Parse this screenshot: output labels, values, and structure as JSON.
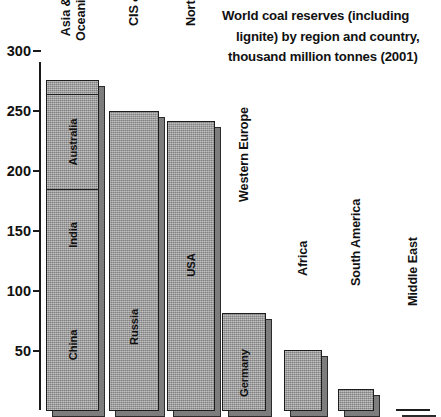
{
  "chart": {
    "title_lines": [
      "World coal reserves (including",
      "lignite) by region and country,",
      "thousand million tonnes (2001)"
    ],
    "axis": {
      "ticks": [
        "300",
        "250",
        "200",
        "150",
        "100",
        "50"
      ]
    }
  },
  "chart_data": {
    "type": "bar",
    "title": "World coal reserves (including lignite) by region and country, thousand million tonnes (2001)",
    "xlabel": "",
    "ylabel": "",
    "ylim": [
      0,
      310
    ],
    "yticks": [
      50,
      100,
      150,
      200,
      250,
      300
    ],
    "grid": false,
    "legend": "none",
    "stacked": true,
    "note": "Each regional bar is subdivided to show major constituent countries; the unlabelled remainder is the rest of the region.",
    "categories": [
      "Asia & Oceania",
      "CIS & E. Europe",
      "North America",
      "Western Europe",
      "Africa",
      "South America",
      "Middle East"
    ],
    "values": [
      276,
      250,
      242,
      82,
      51,
      18,
      2
    ],
    "segments": [
      {
        "category": "Asia & Oceania",
        "total": 276,
        "parts": [
          {
            "label": "China",
            "value": 109
          },
          {
            "label": "India",
            "value": 75
          },
          {
            "label": "Australia",
            "value": 79
          },
          {
            "label": "",
            "value": 13
          }
        ]
      },
      {
        "category": "CIS & E. Europe",
        "total": 250,
        "parts": [
          {
            "label": "Russia",
            "value": 138
          },
          {
            "label": "",
            "value": 112
          }
        ]
      },
      {
        "category": "North America",
        "total": 242,
        "parts": [
          {
            "label": "USA",
            "value": 242
          }
        ]
      },
      {
        "category": "Western Europe",
        "total": 82,
        "parts": [
          {
            "label": "Germany",
            "value": 62
          },
          {
            "label": "",
            "value": 20
          }
        ]
      },
      {
        "category": "Africa",
        "total": 51,
        "parts": [
          {
            "label": "",
            "value": 51
          }
        ]
      },
      {
        "category": "South America",
        "total": 18,
        "parts": [
          {
            "label": "",
            "value": 18
          }
        ]
      },
      {
        "category": "Middle East",
        "total": 2,
        "parts": [
          {
            "label": "",
            "value": 2
          }
        ]
      }
    ],
    "colors": {
      "bar_fill": "#9c9c9c",
      "bar_edge": "#1d1d1d",
      "bar_shadow": "#7d7d7d",
      "text": "#111111",
      "background": "#ffffff"
    }
  }
}
